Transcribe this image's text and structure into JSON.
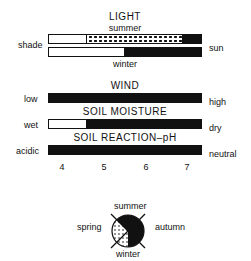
{
  "light": {
    "title": "LIGHT",
    "summer_label": "summer",
    "winter_label": "winter",
    "left_label": "shade",
    "right_label": "sun"
  },
  "wind": {
    "title": "WIND",
    "left_label": "low",
    "right_label": "high"
  },
  "soil_moisture": {
    "title": "SOIL MOISTURE",
    "left_label": "wet",
    "right_label": "dry"
  },
  "soil_ph": {
    "title": "SOIL REACTION–pH",
    "left_label": "acidic",
    "right_label": "neutral",
    "ticks": [
      "4",
      "5",
      "6",
      "7"
    ]
  },
  "seasons": {
    "top": "summer",
    "left": "spring",
    "right": "autumn",
    "bottom": "winter"
  },
  "colors": {
    "fill": "#111111",
    "background": "#ffffff"
  }
}
